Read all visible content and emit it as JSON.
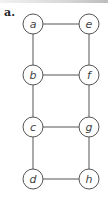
{
  "figure": {
    "panel_label": "a.",
    "colors": {
      "stroke": "#555555",
      "node_fill": "#ffffff",
      "label": "#444444"
    }
  },
  "graph": {
    "nodes": [
      {
        "id": "a",
        "label": "a",
        "x": 33,
        "y": 24
      },
      {
        "id": "e",
        "label": "e",
        "x": 89,
        "y": 24
      },
      {
        "id": "b",
        "label": "b",
        "x": 33,
        "y": 75
      },
      {
        "id": "f",
        "label": "f",
        "x": 89,
        "y": 75
      },
      {
        "id": "c",
        "label": "c",
        "x": 33,
        "y": 127
      },
      {
        "id": "g",
        "label": "g",
        "x": 89,
        "y": 127
      },
      {
        "id": "d",
        "label": "d",
        "x": 33,
        "y": 179
      },
      {
        "id": "h",
        "label": "h",
        "x": 89,
        "y": 179
      }
    ],
    "edges": [
      [
        "a",
        "e"
      ],
      [
        "a",
        "b"
      ],
      [
        "e",
        "f"
      ],
      [
        "b",
        "f"
      ],
      [
        "b",
        "c"
      ],
      [
        "f",
        "g"
      ],
      [
        "c",
        "g"
      ],
      [
        "c",
        "d"
      ],
      [
        "g",
        "h"
      ],
      [
        "d",
        "h"
      ]
    ]
  }
}
